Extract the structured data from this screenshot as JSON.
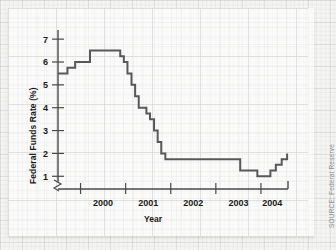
{
  "figure": {
    "axis_label_x": "Year",
    "axis_label_y": "Federal Funds Rate (%)",
    "source_note": "SOURCE: Federal Reserve",
    "line_color": "#58585a",
    "axis_color": "#4a4a4a",
    "grid_color": "#d9d9e2",
    "background_color": "#f4f4f2",
    "card_color": "#ffffff"
  },
  "chart_data": {
    "type": "line",
    "title": "",
    "xlabel": "Year",
    "ylabel": "Federal Funds Rate (%)",
    "xlim": [
      1999.5,
      2004.6
    ],
    "ylim": [
      0.75,
      7.4
    ],
    "yticks": [
      1,
      2,
      3,
      4,
      5,
      6,
      7
    ],
    "ytick_labels": [
      "1",
      "2",
      "3",
      "4",
      "5",
      "6",
      "7"
    ],
    "xticks": [
      2000.0,
      2001.0,
      2002.0,
      2003.0,
      2004.0,
      2004.6
    ],
    "xtick_labels": [
      "2000",
      "2001",
      "2002",
      "2003",
      "2004"
    ],
    "xtick_label_positions": [
      2000.5,
      2001.5,
      2002.5,
      2003.5,
      2004.25
    ],
    "y_axis_break": true,
    "grid": true,
    "legend": null,
    "step_style": "post",
    "series": [
      {
        "name": "Federal Funds Rate",
        "color": "#58585a",
        "x": [
          1999.5,
          1999.71,
          1999.88,
          2000.04,
          2000.21,
          2000.46,
          2000.79,
          2000.88,
          2000.96,
          2001.04,
          2001.13,
          2001.21,
          2001.29,
          2001.38,
          2001.46,
          2001.54,
          2001.63,
          2001.71,
          2001.79,
          2001.88,
          2002.54,
          2003.54,
          2003.92,
          2004.08,
          2004.21,
          2004.33,
          2004.46,
          2004.58
        ],
        "y": [
          5.5,
          5.75,
          6.0,
          6.0,
          6.5,
          6.5,
          6.5,
          6.25,
          6.0,
          5.5,
          5.0,
          4.5,
          4.0,
          4.0,
          3.75,
          3.5,
          3.0,
          2.5,
          2.0,
          1.75,
          1.75,
          1.25,
          1.0,
          1.0,
          1.25,
          1.5,
          1.75,
          2.0
        ]
      }
    ],
    "annotations": [
      {
        "text": "peak",
        "value": 6.5
      },
      {
        "text": "trough",
        "value": 1.0
      },
      {
        "text": "end",
        "value": 2.0
      }
    ]
  }
}
